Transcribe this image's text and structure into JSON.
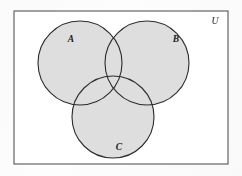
{
  "figure": {
    "kind": "venn-diagram",
    "caption_text": "",
    "canvas": {
      "width": 242,
      "height": 176
    },
    "background_color": "#ffffff"
  },
  "universe": {
    "label": "U",
    "label_x": 215,
    "label_y": 24,
    "label_size": 9.5,
    "rect": {
      "x": 14,
      "y": 11,
      "width": 214,
      "height": 153
    },
    "stroke_color": "#575757",
    "stroke_width": 1.1,
    "fill_color": "#ffffff"
  },
  "style": {
    "circle_fill": "#dedede",
    "circle_stroke": "#2b2b2b",
    "circle_stroke_width": 1.1,
    "label_color": "#1a1a1a"
  },
  "sets": [
    {
      "id": "A",
      "label": "A",
      "cx": 80,
      "cy": 63,
      "r": 42,
      "label_x": 71,
      "label_y": 42,
      "label_size": 9.5
    },
    {
      "id": "B",
      "label": "B",
      "cx": 147,
      "cy": 63,
      "r": 42,
      "label_x": 176,
      "label_y": 42,
      "label_size": 9.5
    },
    {
      "id": "C",
      "label": "C",
      "cx": 113,
      "cy": 117,
      "r": 41,
      "label_x": 119,
      "label_y": 150,
      "label_size": 9.5
    }
  ]
}
